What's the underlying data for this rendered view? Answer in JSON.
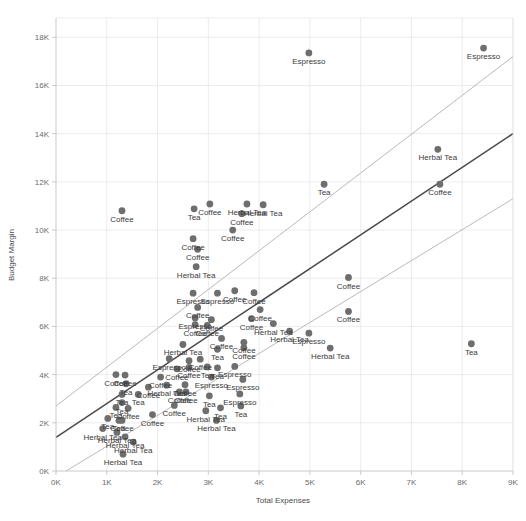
{
  "chart_data": {
    "type": "scatter",
    "title": "",
    "xlabel": "Total Expenses",
    "ylabel": "Budget Margin",
    "xlim": [
      0,
      9000
    ],
    "ylim": [
      0,
      18800
    ],
    "xticks": [
      "0K",
      "1K",
      "2K",
      "3K",
      "4K",
      "5K",
      "6K",
      "7K",
      "8K",
      "9K"
    ],
    "xtick_values": [
      0,
      1000,
      2000,
      3000,
      4000,
      5000,
      6000,
      7000,
      8000,
      9000
    ],
    "yticks": [
      "0K",
      "2K",
      "4K",
      "6K",
      "8K",
      "10K",
      "12K",
      "14K",
      "16K",
      "18K"
    ],
    "ytick_values": [
      0,
      2000,
      4000,
      6000,
      8000,
      10000,
      12000,
      14000,
      16000,
      18000
    ],
    "grid": true,
    "legend": "none",
    "point_color": "#6e6e6e",
    "trendline_color": "#4a4a4a",
    "confidence_band_color": "#a8a8a8",
    "trendlines": [
      {
        "name": "upper-bound",
        "x0": 0,
        "y0": 2700,
        "x1": 9000,
        "y1": 17200
      },
      {
        "name": "fit",
        "x0": 0,
        "y0": 1400,
        "x1": 9000,
        "y1": 14000
      },
      {
        "name": "lower-bound",
        "x0": 200,
        "y0": 0,
        "x1": 9000,
        "y1": 11300
      }
    ],
    "points": [
      {
        "x": 4980,
        "y": 17350,
        "label": "Espresso"
      },
      {
        "x": 8420,
        "y": 17550,
        "label": "Espresso"
      },
      {
        "x": 7520,
        "y": 13350,
        "label": "Herbal Tea"
      },
      {
        "x": 7560,
        "y": 11900,
        "label": "Coffee"
      },
      {
        "x": 5280,
        "y": 11900,
        "label": "Tea"
      },
      {
        "x": 1300,
        "y": 10800,
        "label": "Coffee"
      },
      {
        "x": 2720,
        "y": 10880,
        "label": "Tea"
      },
      {
        "x": 3030,
        "y": 11080,
        "label": "Coffee"
      },
      {
        "x": 3760,
        "y": 11080,
        "label": "Herbal Tea"
      },
      {
        "x": 4080,
        "y": 11050,
        "label": "Herbal Tea"
      },
      {
        "x": 3660,
        "y": 10680,
        "label": "Coffee"
      },
      {
        "x": 2700,
        "y": 9640,
        "label": "Coffee"
      },
      {
        "x": 3480,
        "y": 10000,
        "label": "Coffee"
      },
      {
        "x": 2790,
        "y": 9200,
        "label": "Coffee"
      },
      {
        "x": 2760,
        "y": 8480,
        "label": "Herbal Tea"
      },
      {
        "x": 2700,
        "y": 7380,
        "label": "Espresso"
      },
      {
        "x": 3180,
        "y": 7380,
        "label": "Espresso"
      },
      {
        "x": 3520,
        "y": 7480,
        "label": "Coffee"
      },
      {
        "x": 3900,
        "y": 7400,
        "label": "Coffee"
      },
      {
        "x": 5760,
        "y": 8030,
        "label": "Coffee"
      },
      {
        "x": 2790,
        "y": 6790,
        "label": "Coffee"
      },
      {
        "x": 2740,
        "y": 6350,
        "label": "Espresso"
      },
      {
        "x": 3060,
        "y": 6280,
        "label": "Coffee"
      },
      {
        "x": 4020,
        "y": 6700,
        "label": "Coffee"
      },
      {
        "x": 3850,
        "y": 6320,
        "label": "Coffee"
      },
      {
        "x": 2740,
        "y": 6070,
        "label": "Coffee"
      },
      {
        "x": 2980,
        "y": 6040,
        "label": "Coffee"
      },
      {
        "x": 4280,
        "y": 6120,
        "label": "Herbal Tea"
      },
      {
        "x": 5760,
        "y": 6620,
        "label": "Coffee"
      },
      {
        "x": 2500,
        "y": 5250,
        "label": "Herbal Tea"
      },
      {
        "x": 3260,
        "y": 5500,
        "label": "Coffee"
      },
      {
        "x": 3700,
        "y": 5340,
        "label": "Coffee"
      },
      {
        "x": 4600,
        "y": 5800,
        "label": "Herbal Tea"
      },
      {
        "x": 4980,
        "y": 5720,
        "label": "Espresso"
      },
      {
        "x": 3180,
        "y": 5050,
        "label": "Tea"
      },
      {
        "x": 3700,
        "y": 5120,
        "label": "Coffee"
      },
      {
        "x": 2230,
        "y": 4660,
        "label": "Espresso"
      },
      {
        "x": 2620,
        "y": 4580,
        "label": "Coffee"
      },
      {
        "x": 2840,
        "y": 4640,
        "label": "Coffee"
      },
      {
        "x": 8180,
        "y": 5280,
        "label": "Tea"
      },
      {
        "x": 5400,
        "y": 5100,
        "label": "Herbal Tea"
      },
      {
        "x": 2380,
        "y": 4240,
        "label": "Coffee"
      },
      {
        "x": 2620,
        "y": 4300,
        "label": "Coffee"
      },
      {
        "x": 2980,
        "y": 4320,
        "label": "Tea"
      },
      {
        "x": 3180,
        "y": 4280,
        "label": "Tea"
      },
      {
        "x": 3520,
        "y": 4340,
        "label": "Espresso"
      },
      {
        "x": 1180,
        "y": 4000,
        "label": "Coffee"
      },
      {
        "x": 1360,
        "y": 3980,
        "label": "Coffee"
      },
      {
        "x": 1380,
        "y": 3620,
        "label": "Tea"
      },
      {
        "x": 2060,
        "y": 3900,
        "label": "Coffee"
      },
      {
        "x": 1820,
        "y": 3480,
        "label": "Coffee"
      },
      {
        "x": 2180,
        "y": 3560,
        "label": "Herbal Tea"
      },
      {
        "x": 2540,
        "y": 3580,
        "label": "Coffee"
      },
      {
        "x": 3060,
        "y": 3900,
        "label": "Espresso"
      },
      {
        "x": 3680,
        "y": 3800,
        "label": "Espresso"
      },
      {
        "x": 1300,
        "y": 3180,
        "label": "Tea"
      },
      {
        "x": 1620,
        "y": 3180,
        "label": "Tea"
      },
      {
        "x": 2430,
        "y": 3280,
        "label": "Coffee"
      },
      {
        "x": 2560,
        "y": 3280,
        "label": "Coffee"
      },
      {
        "x": 3020,
        "y": 3120,
        "label": "Tea"
      },
      {
        "x": 3620,
        "y": 3200,
        "label": "Espresso"
      },
      {
        "x": 1300,
        "y": 2840,
        "label": "Tea"
      },
      {
        "x": 1180,
        "y": 2640,
        "label": "Tea"
      },
      {
        "x": 1420,
        "y": 2600,
        "label": "Coffee"
      },
      {
        "x": 1900,
        "y": 2340,
        "label": "Coffee"
      },
      {
        "x": 2330,
        "y": 2720,
        "label": "Coffee"
      },
      {
        "x": 3240,
        "y": 2620,
        "label": "Tea"
      },
      {
        "x": 3640,
        "y": 2700,
        "label": "Tea"
      },
      {
        "x": 1020,
        "y": 2180,
        "label": "Tea"
      },
      {
        "x": 1240,
        "y": 2100,
        "label": "Tea"
      },
      {
        "x": 1300,
        "y": 2100,
        "label": "Coffee"
      },
      {
        "x": 2950,
        "y": 2500,
        "label": "Herbal Tea"
      },
      {
        "x": 3160,
        "y": 2100,
        "label": "Herbal Tea"
      },
      {
        "x": 920,
        "y": 1760,
        "label": "Herbal Tea"
      },
      {
        "x": 1200,
        "y": 1600,
        "label": "Herbal Tea"
      },
      {
        "x": 1360,
        "y": 1420,
        "label": "Herbal Tea"
      },
      {
        "x": 1520,
        "y": 1200,
        "label": "Herbal Tea"
      },
      {
        "x": 1320,
        "y": 700,
        "label": "Herbal Tea"
      }
    ],
    "label_offsets": {
      "default": {
        "dx": 0,
        "dy": 11,
        "anchor": "middle"
      }
    }
  }
}
